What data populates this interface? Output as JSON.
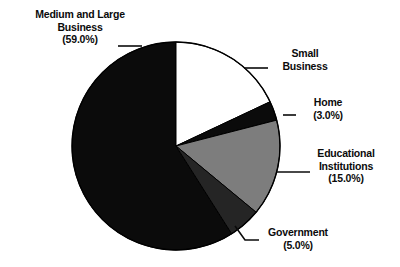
{
  "chart_data": {
    "type": "pie",
    "title": "",
    "subtitle": "",
    "xlabel": "",
    "ylabel": "",
    "legend_position": "none",
    "grid": false,
    "start_angle_deg": 0,
    "direction": "clockwise",
    "center": {
      "x": 176,
      "y": 146
    },
    "radius": 104,
    "categories": [
      "Small Business",
      "Home",
      "Educational Institutions",
      "Government",
      "Medium and Large Business"
    ],
    "values": [
      18.0,
      3.0,
      15.0,
      5.0,
      59.0
    ],
    "slices": [
      {
        "name": "Small Business",
        "label_line1": "Small",
        "label_line2": "Business",
        "percent_text": "",
        "value": 18.0,
        "color": "#ffffff",
        "stroke": "#000000",
        "start_deg": 0,
        "end_deg": 64.8
      },
      {
        "name": "Home",
        "label_line1": "Home",
        "label_line2": "(3.0%)",
        "percent_text": "(3.0%)",
        "value": 3.0,
        "color": "#0b0b0b",
        "stroke": "#000000",
        "start_deg": 64.8,
        "end_deg": 75.6
      },
      {
        "name": "Educational Institutions",
        "label_line1": "Educational",
        "label_line2": "Institutions",
        "percent_text": "(15.0%)",
        "value": 15.0,
        "color": "#7d7d7d",
        "stroke": "#000000",
        "start_deg": 75.6,
        "end_deg": 129.6
      },
      {
        "name": "Government",
        "label_line1": "Government",
        "label_line2": "(5.0%)",
        "percent_text": "(5.0%)",
        "value": 5.0,
        "color": "#252525",
        "stroke": "#000000",
        "start_deg": 129.6,
        "end_deg": 147.6
      },
      {
        "name": "Medium and Large Business",
        "label_line1": "Medium and Large",
        "label_line2": "Business",
        "percent_text": "(59.0%)",
        "value": 59.0,
        "color": "#0b0b0b",
        "stroke": "#000000",
        "start_deg": 147.6,
        "end_deg": 360
      }
    ],
    "colors": {
      "background": "#ffffff",
      "text": "#0b0b0b",
      "outline": "#000000",
      "white_slice": "#ffffff",
      "black_slice": "#0b0b0b",
      "medium_gray_slice": "#7d7d7d",
      "dark_gray_slice": "#252525",
      "leader_line": "#0b0b0b"
    }
  },
  "labels": {
    "medium_large": {
      "line1": "Medium and Large",
      "line2": "Business",
      "line3": "(59.0%)"
    },
    "small_business": {
      "line1": "Small",
      "line2": "Business"
    },
    "home": {
      "line1": "Home",
      "line2": "(3.0%)"
    },
    "educational": {
      "line1": "Educational",
      "line2": "Institutions",
      "line3": "(15.0%)"
    },
    "government": {
      "line1": "Government",
      "line2": "(5.0%)"
    }
  }
}
